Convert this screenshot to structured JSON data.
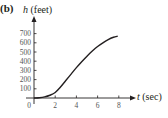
{
  "panel_label": "(b)",
  "chart_data": {
    "type": "line",
    "title": "",
    "xlabel": "t (sec)",
    "ylabel": "h (feet)",
    "x_var": "t",
    "x_unit": "(sec)",
    "y_var": "h",
    "y_unit": "(feet)",
    "x_ticks": [
      0,
      2,
      4,
      6,
      8
    ],
    "y_ticks": [
      100,
      200,
      300,
      400,
      500,
      600,
      700
    ],
    "xlim": [
      0,
      9
    ],
    "ylim": [
      0,
      800
    ],
    "grid": false,
    "legend": null,
    "series": [
      {
        "name": "h(t)",
        "x": [
          0,
          0.5,
          1,
          1.5,
          2,
          2.5,
          3,
          3.5,
          4,
          4.5,
          5,
          5.5,
          6,
          6.5,
          7,
          7.5,
          7.9
        ],
        "y": [
          0,
          3,
          12,
          30,
          60,
          120,
          190,
          260,
          330,
          395,
          455,
          510,
          560,
          600,
          635,
          660,
          672
        ]
      }
    ]
  },
  "colors": {
    "curve": "#231f20",
    "axis": "#231f20",
    "tick_text": "#555555"
  }
}
